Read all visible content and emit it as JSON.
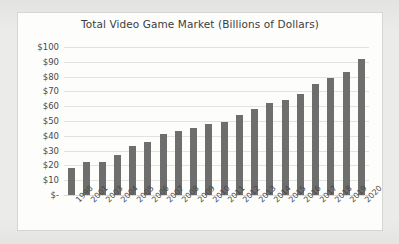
{
  "chart_data": {
    "type": "bar",
    "title": "Total Video Game Market (Billions of Dollars)",
    "xlabel": "",
    "ylabel": "",
    "ylim": [
      0,
      100
    ],
    "ytick_labels": [
      "$-",
      "$10",
      "$20",
      "$30",
      "$40",
      "$50",
      "$60",
      "$70",
      "$80",
      "$90",
      "$100"
    ],
    "ytick_values": [
      0,
      10,
      20,
      30,
      40,
      50,
      60,
      70,
      80,
      90,
      100
    ],
    "grid": true,
    "legend": "none",
    "categories": [
      "1998",
      "2001",
      "2003",
      "2004",
      "2005",
      "2006",
      "2007",
      "2008",
      "2009",
      "2010",
      "2011",
      "2012",
      "2013",
      "2014",
      "2015",
      "2016",
      "2017",
      "2018",
      "2019",
      "2020"
    ],
    "series": [
      {
        "name": "Total Video Game Market",
        "values": [
          18,
          22,
          22,
          27,
          33,
          36,
          41,
          43,
          45,
          48,
          49,
          54,
          58,
          62,
          64,
          68,
          75,
          79,
          83,
          92
        ]
      }
    ]
  }
}
